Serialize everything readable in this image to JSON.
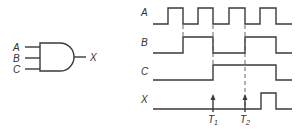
{
  "gate": {
    "type": "AND",
    "inputs": [
      "A",
      "B",
      "C"
    ],
    "output": "X"
  },
  "timing": {
    "signals": [
      {
        "name": "A",
        "label": "A"
      },
      {
        "name": "B",
        "label": "B"
      },
      {
        "name": "C",
        "label": "C"
      },
      {
        "name": "X",
        "label": "X"
      }
    ],
    "markers": [
      {
        "label": "T",
        "sub": "1"
      },
      {
        "label": "T",
        "sub": "2"
      }
    ]
  },
  "colors": {
    "stroke": "#3a3a3a",
    "background": "#ffffff"
  }
}
